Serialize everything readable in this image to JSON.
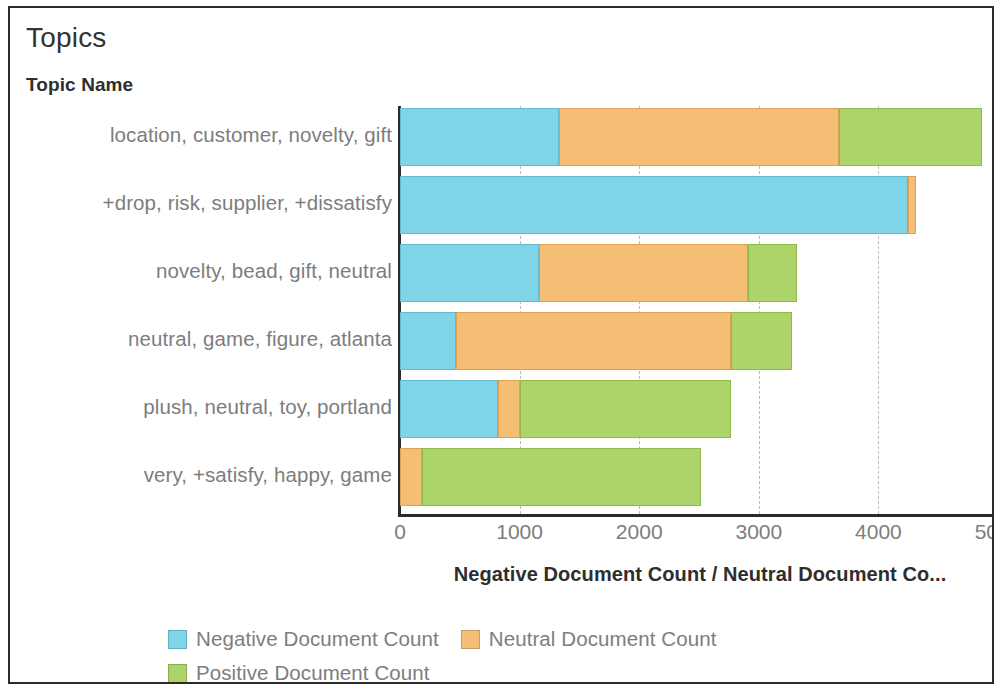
{
  "card": {
    "title": "Topics",
    "column_header": "Topic Name"
  },
  "chart_data": {
    "type": "bar",
    "orientation": "horizontal",
    "stacked": true,
    "title": "Topics",
    "xlabel": "Negative Document Count / Neutral Document Co...",
    "xlabel_full": "Negative Document Count / Neutral Document Count / Positive Document Count",
    "ylabel": "Topic Name",
    "xlim": [
      0,
      5100
    ],
    "xticks": [
      0,
      1000,
      2000,
      3000,
      4000,
      5000
    ],
    "xtick_labels": [
      "0",
      "1000",
      "2000",
      "3000",
      "4000",
      "5000"
    ],
    "grid": true,
    "grid_axis": "x",
    "legend_position": "bottom-left",
    "categories": [
      "location, customer, novelty, gift",
      "+drop, risk, supplier, +dissatisfy",
      "novelty, bead, gift, neutral",
      "neutral, game, figure, atlanta",
      "plush, neutral, toy, portland",
      "very, +satisfy, happy, game"
    ],
    "series": [
      {
        "name": "Negative Document Count",
        "color": "#7fd4e8",
        "values": [
          1330,
          4250,
          1160,
          470,
          820,
          0
        ]
      },
      {
        "name": "Neutral Document Count",
        "color": "#f4bf74",
        "values": [
          2340,
          60,
          1750,
          2300,
          180,
          180
        ]
      },
      {
        "name": "Positive Document Count",
        "color": "#acd468",
        "values": [
          1200,
          0,
          410,
          510,
          1770,
          2340
        ]
      }
    ],
    "totals": [
      4870,
      4310,
      3320,
      3280,
      2770,
      2520
    ]
  },
  "legend": {
    "items": [
      {
        "label": "Negative Document Count",
        "color": "#7fd4e8"
      },
      {
        "label": "Neutral Document Count",
        "color": "#f4bf74"
      },
      {
        "label": "Positive Document Count",
        "color": "#acd468"
      }
    ]
  }
}
